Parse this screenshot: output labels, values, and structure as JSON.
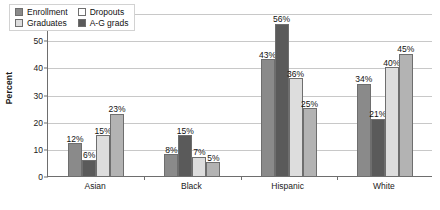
{
  "chart_data": {
    "type": "bar",
    "title": "",
    "xlabel": "",
    "ylabel": "Percent",
    "ylim": [
      0,
      60
    ],
    "yticks": [
      0,
      10,
      20,
      30,
      40,
      50,
      60
    ],
    "grid": true,
    "legend_position": "top-left-inside",
    "categories": [
      "Asian",
      "Black",
      "Hispanic",
      "White"
    ],
    "series": [
      {
        "name": "Enrollment",
        "color": "#8a8a8a",
        "values": [
          12,
          8,
          43,
          34
        ]
      },
      {
        "name": "Dropouts",
        "color": "#5a5a5a",
        "values": [
          6,
          15,
          56,
          21
        ]
      },
      {
        "name": "Graduates",
        "color": "#dddddd",
        "values": [
          15,
          7,
          36,
          40
        ]
      },
      {
        "name": "A-G grads",
        "color": "#b3b3b3",
        "values": [
          23,
          5,
          25,
          45
        ]
      }
    ],
    "value_labels": [
      [
        "12%",
        "6%",
        "15%",
        "23%"
      ],
      [
        "8%",
        "15%",
        "7%",
        "5%"
      ],
      [
        "43%",
        "56%",
        "36%",
        "25%"
      ],
      [
        "34%",
        "21%",
        "40%",
        "45%"
      ]
    ],
    "legend_order": [
      "Enrollment",
      "Dropouts",
      "Graduates",
      "A-G grads"
    ],
    "legend_swatches": {
      "Enrollment": "#8a8a8a",
      "Dropouts": "#ffffff",
      "Graduates": "#dddddd",
      "A-G grads": "#5a5a5a"
    }
  }
}
